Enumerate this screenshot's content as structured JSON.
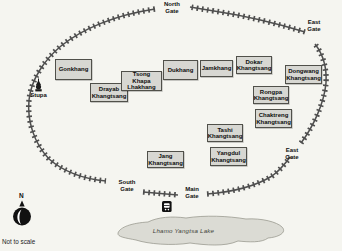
{
  "map": {
    "type": "monastery-compound-map",
    "scale_note": "Not to scale",
    "compass_north_label": "N"
  },
  "gates": [
    {
      "id": "north-gate",
      "label": "North Gate"
    },
    {
      "id": "east-gate-north",
      "label": "East Gate"
    },
    {
      "id": "east-gate-south",
      "label": "East Gate"
    },
    {
      "id": "south-gate",
      "label": "South Gate"
    },
    {
      "id": "main-gate",
      "label": "Main Gate"
    }
  ],
  "buildings": [
    {
      "label": "Gonkhang"
    },
    {
      "label": "Drayab Khangtsang"
    },
    {
      "label": "Tsong Khapa Lhakhang"
    },
    {
      "label": "Dukhang"
    },
    {
      "label": "Jamkhang"
    },
    {
      "label": "Dokar Khangtsang"
    },
    {
      "label": "Dongwang Khangtsang"
    },
    {
      "label": "Rongpa Khangtsang"
    },
    {
      "label": "Chaktreng Khangtsang"
    },
    {
      "label": "Tashi Khangtsang"
    },
    {
      "label": "Yangdul Khangtsang"
    },
    {
      "label": "Jang Khangtsang"
    }
  ],
  "landmarks": {
    "stupa_label": "Stupa",
    "lake_label": "Lhamo Yangtsa Lake"
  },
  "icons": {
    "wall": "crenellated-wall",
    "stupa": "stupa-icon",
    "bus_stop": "bus-stop-icon",
    "compass": "compass-north-icon"
  },
  "colors": {
    "background": "#f5f5f0",
    "wall": "#4f4f4f",
    "building_fill": "#d7d7d2",
    "building_border": "#50504a",
    "lake_fill": "#dbdbd4",
    "lake_border": "#9a9a90",
    "icon_black": "#111111"
  }
}
